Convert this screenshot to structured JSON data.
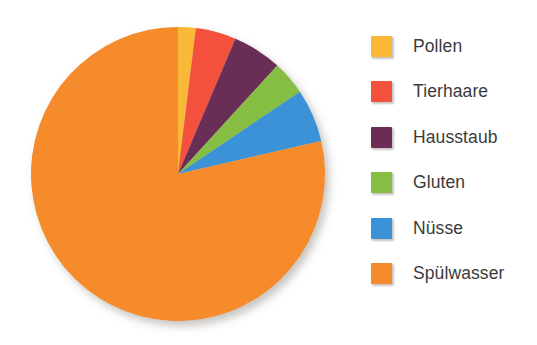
{
  "chart_data": {
    "type": "pie",
    "title": "",
    "subtitle": "",
    "xlabel": "",
    "ylabel": "",
    "legend_position": "right",
    "grid": false,
    "start_angle_deg": 0,
    "direction": "clockwise",
    "categories": [
      "Pollen",
      "Tierhaare",
      "Hausstaub",
      "Gluten",
      "Nüsse",
      "Spülwasser"
    ],
    "values": [
      2.0,
      4.4,
      5.4,
      3.8,
      5.8,
      78.6
    ],
    "unit": "%",
    "colors": [
      "#F9B837",
      "#F3513C",
      "#6B2D56",
      "#85BE42",
      "#3B92D6",
      "#F58B2C"
    ],
    "slices": [
      {
        "label": "Pollen",
        "value": 2.0,
        "color": "#F9B837",
        "start_deg": 0.0,
        "end_deg": 7.0
      },
      {
        "label": "Tierhaare",
        "value": 4.4,
        "color": "#F3513C",
        "start_deg": 7.0,
        "end_deg": 23.0
      },
      {
        "label": "Hausstaub",
        "value": 5.4,
        "color": "#6B2D56",
        "start_deg": 23.0,
        "end_deg": 42.5
      },
      {
        "label": "Gluten",
        "value": 3.8,
        "color": "#85BE42",
        "start_deg": 42.5,
        "end_deg": 56.0
      },
      {
        "label": "Nüsse",
        "value": 5.8,
        "color": "#3B92D6",
        "start_deg": 56.0,
        "end_deg": 77.0
      },
      {
        "label": "Spülwasser",
        "value": 78.6,
        "color": "#F58B2C",
        "start_deg": 77.0,
        "end_deg": 360.0
      }
    ]
  },
  "legend": {
    "items": [
      {
        "label": "Pollen",
        "color": "#F9B837"
      },
      {
        "label": "Tierhaare",
        "color": "#F3513C"
      },
      {
        "label": "Hausstaub",
        "color": "#6B2D56"
      },
      {
        "label": "Gluten",
        "color": "#85BE42"
      },
      {
        "label": "Nüsse",
        "color": "#3B92D6"
      },
      {
        "label": "Spülwasser",
        "color": "#F58B2C"
      }
    ]
  },
  "pie_geometry": {
    "center_x": 178,
    "center_y": 174,
    "radius": 147
  },
  "background_color": "#FFFFFF"
}
